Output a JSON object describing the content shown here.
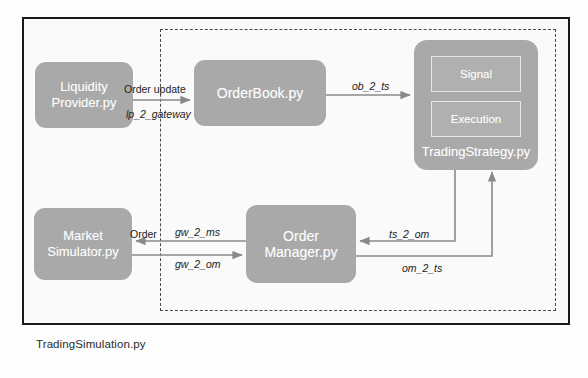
{
  "diagram": {
    "outer_container_label": "TradingSimulation.py",
    "nodes": {
      "liquidity_provider": "Liquidity\nProvider.py",
      "order_book": "OrderBook.py",
      "trading_strategy": "TradingStrategy.py",
      "strategy_signal": "Signal",
      "strategy_execution": "Execution",
      "market_simulator": "Market\nSimulator.py",
      "order_manager": "Order\nManager.py"
    },
    "connections": {
      "order_update": "Order update",
      "lp_2_gateway": "lp_2_gateway",
      "ob_2_ts": "ob_2_ts",
      "order": "Order",
      "gw_2_ms": "gw_2_ms",
      "gw_2_om": "gw_2_om",
      "ts_2_om": "ts_2_om",
      "om_2_ts": "om_2_ts"
    },
    "colors": {
      "node_fill": "#a9a9a9",
      "sub_node_fill": "#b0b0b0",
      "outer_border": "#1a1a1a",
      "dashed_border": "#4a4a4a",
      "connector": "#8a8a8a",
      "background": "#fdfdfd",
      "node_text": "#ffffff",
      "label_text": "#222222"
    }
  }
}
